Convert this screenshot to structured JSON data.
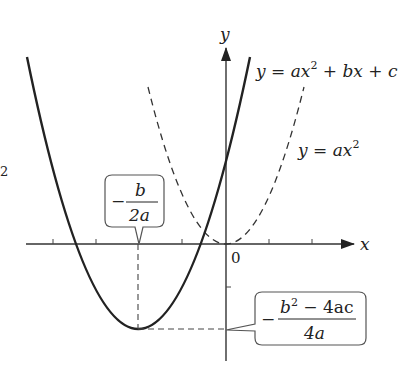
{
  "diagram": {
    "axes": {
      "x_label": "x",
      "y_label": "y",
      "origin_label": "0"
    },
    "curves": [
      {
        "name": "solid-parabola",
        "label_parts": [
          "y",
          " = ",
          "a",
          "x",
          "2",
          " + ",
          "b",
          "x",
          " + ",
          "c"
        ],
        "label": "y = ax² + bx + c",
        "style": "solid"
      },
      {
        "name": "dashed-parabola",
        "label_parts": [
          "y",
          " = ",
          "a",
          "x",
          "2"
        ],
        "label": "y = ax²",
        "style": "dashed"
      }
    ],
    "callouts": {
      "vertex_x": {
        "sign": "−",
        "numerator": "b",
        "denominator": "2a",
        "text": "−b/2a"
      },
      "vertex_y": {
        "sign": "−",
        "numerator_b": "b",
        "numerator_sup": "2",
        "numerator_rest": " − 4ac",
        "denominator": "4a",
        "text": "−(b² − 4ac)/4a"
      }
    },
    "edge_fragment": "2",
    "colors": {
      "line": "#222222",
      "callout_border": "#555555",
      "axis": "#333333"
    }
  }
}
